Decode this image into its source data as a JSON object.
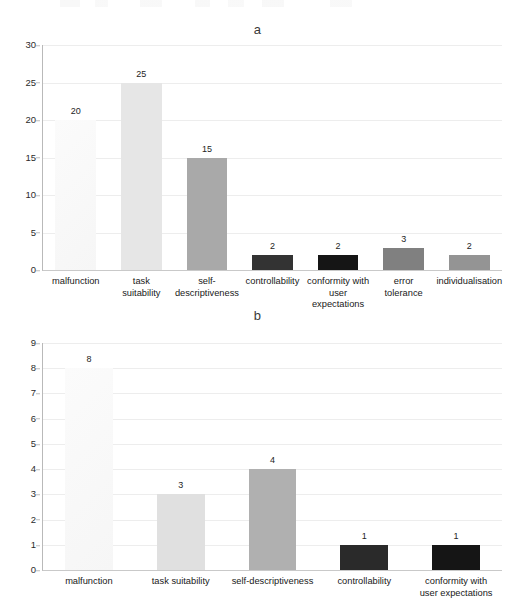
{
  "page": {
    "background_color": "#ffffff",
    "text_color": "#1c1c1c"
  },
  "chart_data": [
    {
      "id": "a",
      "type": "bar",
      "title": "a",
      "xlabel": "",
      "ylabel": "",
      "ylim": [
        0,
        30
      ],
      "yticks": [
        0,
        5,
        10,
        15,
        20,
        25,
        30
      ],
      "grid": true,
      "legend": "none",
      "categories": [
        "malfunction",
        "task suitability",
        "self-descriptiveness",
        "controllability",
        "conformity with user expectations",
        "error tolerance",
        "individualisation"
      ],
      "category_lines": [
        [
          "malfunction"
        ],
        [
          "task",
          "suitability"
        ],
        [
          "self-",
          "descriptiveness"
        ],
        [
          "controllability"
        ],
        [
          "conformity with",
          "user expectations"
        ],
        [
          "error",
          "tolerance"
        ],
        [
          "individualisation"
        ]
      ],
      "values": [
        20,
        25,
        15,
        2,
        2,
        3,
        2
      ],
      "bar_colors": [
        "#fafafa",
        "#e6e6e6",
        "#a9a9a9",
        "#333333",
        "#151515",
        "#808080",
        "#949494"
      ]
    },
    {
      "id": "b",
      "type": "bar",
      "title": "b",
      "xlabel": "",
      "ylabel": "",
      "ylim": [
        0,
        9
      ],
      "yticks": [
        0,
        1,
        2,
        3,
        4,
        5,
        6,
        7,
        8,
        9
      ],
      "grid": true,
      "legend": "none",
      "categories": [
        "malfunction",
        "task suitability",
        "self-descriptiveness",
        "controllability",
        "conformity with user expectations"
      ],
      "category_lines": [
        [
          "malfunction"
        ],
        [
          "task suitability"
        ],
        [
          "self-descriptiveness"
        ],
        [
          "controllability"
        ],
        [
          "conformity with",
          "user expectations"
        ]
      ],
      "values": [
        8,
        3,
        4,
        1,
        1
      ],
      "bar_colors": [
        "#fafafa",
        "#e0e0e0",
        "#b0b0b0",
        "#2a2a2a",
        "#151515"
      ]
    }
  ]
}
